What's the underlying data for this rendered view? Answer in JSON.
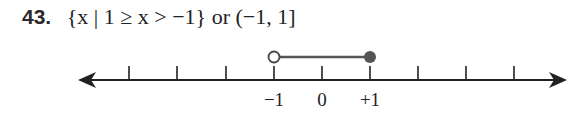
{
  "problem": {
    "number": "43.",
    "set_notation": "{x | 1 ≥ x > −1}",
    "connector": "or",
    "interval_notation": "(−1, 1]"
  },
  "number_line": {
    "ticks": [
      -4,
      -3,
      -2,
      -1,
      0,
      1,
      2,
      3,
      4
    ],
    "labels": [
      {
        "value": -1,
        "text": "−1"
      },
      {
        "value": 0,
        "text": "0"
      },
      {
        "value": 1,
        "text": "+1"
      }
    ],
    "interval": {
      "start": -1,
      "start_closed": false,
      "end": 1,
      "end_closed": true
    },
    "colors": {
      "axis": "#222222",
      "segment": "#555555",
      "closed_dot": "#555555"
    }
  }
}
